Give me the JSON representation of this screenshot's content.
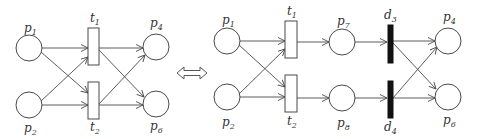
{
  "diagram": {
    "type": "petri-net-equivalence",
    "equivalence_symbol": "double-arrow",
    "colors": {
      "stroke": "#4a4a4a",
      "immediate_transition": "#111111",
      "background": "#ffffff"
    },
    "left_net": {
      "places": [
        {
          "id": "p1",
          "base": "p",
          "sub": "1"
        },
        {
          "id": "p2",
          "base": "p",
          "sub": "2"
        },
        {
          "id": "p4",
          "base": "p",
          "sub": "4"
        },
        {
          "id": "p6",
          "base": "p",
          "sub": "6"
        }
      ],
      "transitions": [
        {
          "id": "t1",
          "base": "t",
          "sub": "1",
          "kind": "timed"
        },
        {
          "id": "t2",
          "base": "t",
          "sub": "2",
          "kind": "timed"
        }
      ],
      "arcs": [
        [
          "p1",
          "t1"
        ],
        [
          "p1",
          "t2"
        ],
        [
          "p2",
          "t1"
        ],
        [
          "p2",
          "t2"
        ],
        [
          "t1",
          "p4"
        ],
        [
          "t1",
          "p6"
        ],
        [
          "t2",
          "p4"
        ],
        [
          "t2",
          "p6"
        ]
      ]
    },
    "right_net": {
      "places": [
        {
          "id": "p1",
          "base": "p",
          "sub": "1"
        },
        {
          "id": "p2",
          "base": "p",
          "sub": "2"
        },
        {
          "id": "p7",
          "base": "p",
          "sub": "7"
        },
        {
          "id": "p8",
          "base": "p",
          "sub": "8"
        },
        {
          "id": "p4",
          "base": "p",
          "sub": "4"
        },
        {
          "id": "p6",
          "base": "p",
          "sub": "6"
        }
      ],
      "transitions": [
        {
          "id": "t1",
          "base": "t",
          "sub": "1",
          "kind": "timed"
        },
        {
          "id": "t2",
          "base": "t",
          "sub": "2",
          "kind": "timed"
        },
        {
          "id": "d3",
          "base": "d",
          "sub": "3",
          "kind": "immediate"
        },
        {
          "id": "d4",
          "base": "d",
          "sub": "4",
          "kind": "immediate"
        }
      ],
      "arcs": [
        [
          "p1",
          "t1"
        ],
        [
          "p1",
          "t2"
        ],
        [
          "p2",
          "t1"
        ],
        [
          "p2",
          "t2"
        ],
        [
          "t1",
          "p7"
        ],
        [
          "t2",
          "p8"
        ],
        [
          "p7",
          "d3"
        ],
        [
          "p8",
          "d4"
        ],
        [
          "d3",
          "p4"
        ],
        [
          "d3",
          "p6"
        ],
        [
          "d4",
          "p4"
        ],
        [
          "d4",
          "p6"
        ]
      ]
    }
  }
}
